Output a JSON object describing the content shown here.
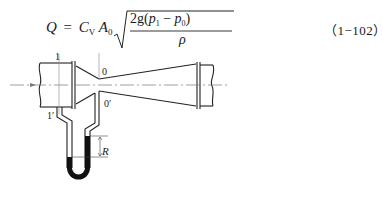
{
  "equation": {
    "lhs_symbol": "Q",
    "equals": "=",
    "coefficient": "C",
    "coefficient_sub": "V",
    "area": "A",
    "area_sub": "0",
    "numerator_prefix": "2g(",
    "p1": "p",
    "p1_sub": "1",
    "minus": " − ",
    "p0": "p",
    "p0_sub": "0",
    "numerator_suffix": ")",
    "denominator": "ρ",
    "tag": "（1−102）"
  },
  "diagram": {
    "labels": {
      "section_1": "1",
      "section_1_prime": "1′",
      "section_0": "0",
      "section_0_prime": "0′",
      "reading": "R"
    },
    "colors": {
      "line": "#222222",
      "manometer_fluid": "#111111",
      "centerline": "#777777"
    }
  }
}
